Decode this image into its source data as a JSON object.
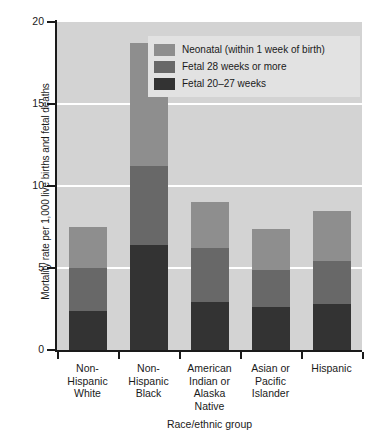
{
  "chart_data": {
    "type": "bar",
    "subtype": "stacked-bar",
    "title": "",
    "xlabel": "Race/ethnic group",
    "ylabel": "Mortality rate per 1,000 live births and fetal deaths",
    "ylim": [
      0,
      20
    ],
    "yticks": [
      0,
      5,
      10,
      15,
      20
    ],
    "ytick_labels": [
      "0",
      "5",
      "10",
      "15",
      "20"
    ],
    "grid": true,
    "grid_color": "#ffffff",
    "plot_background": "#d3d3d3",
    "legend_position": "top-right-inside",
    "categories": [
      "Non-Hispanic White",
      "Non-Hispanic Black",
      "American Indian or Alaska Native",
      "Asian or Pacific Islander",
      "Hispanic"
    ],
    "category_lines": [
      [
        "Non-",
        "Hispanic",
        "White"
      ],
      [
        "Non-",
        "Hispanic",
        "Black"
      ],
      [
        "American",
        "Indian or",
        "Alaska",
        "Native"
      ],
      [
        "Asian or",
        "Pacific",
        "Islander"
      ],
      [
        "Hispanic"
      ]
    ],
    "series": [
      {
        "name": "Fetal 20–27 weeks",
        "color": "#333333",
        "values": [
          2.4,
          6.4,
          2.9,
          2.6,
          2.8
        ]
      },
      {
        "name": "Fetal 28 weeks or more",
        "color": "#686868",
        "values": [
          2.6,
          4.8,
          3.3,
          2.3,
          2.6
        ]
      },
      {
        "name": "Neonatal (within 1 week of birth)",
        "color": "#8e8e8e",
        "values": [
          2.5,
          7.5,
          2.8,
          2.5,
          3.1
        ]
      }
    ],
    "totals": [
      7.5,
      18.7,
      9.0,
      7.4,
      8.5
    ]
  },
  "legend": {
    "items": [
      {
        "label": "Neonatal (within 1 week of birth)",
        "color": "#8e8e8e"
      },
      {
        "label": "Fetal 28 weeks or more",
        "color": "#686868"
      },
      {
        "label": "Fetal 20–27 weeks",
        "color": "#333333"
      }
    ]
  }
}
